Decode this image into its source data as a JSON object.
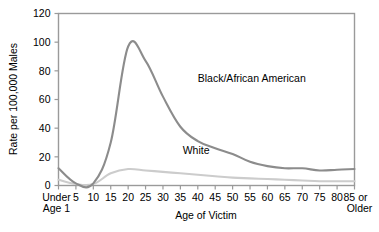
{
  "chart_data": {
    "type": "line",
    "title": "",
    "xlabel": "Age of Victim",
    "ylabel": "Rate per 100,000 Males",
    "xlim": [
      0,
      18
    ],
    "ylim": [
      0,
      120
    ],
    "grid": false,
    "legend_position": "inline-annotation",
    "ytick_labels": [
      "0",
      "20",
      "40",
      "60",
      "80",
      "100",
      "120"
    ],
    "ytick_values": [
      0,
      20,
      40,
      60,
      80,
      100,
      120
    ],
    "xtick_labels": [
      "Under Age 1",
      "5",
      "10",
      "15",
      "20",
      "25",
      "30",
      "35",
      "40",
      "45",
      "50",
      "55",
      "60",
      "65",
      "70",
      "75",
      "80",
      "85 or Older"
    ],
    "categories": [
      "Under Age 1",
      "5",
      "10",
      "15",
      "20",
      "25",
      "30",
      "35",
      "40",
      "45",
      "50",
      "55",
      "60",
      "65",
      "70",
      "75",
      "80",
      "85 or Older"
    ],
    "series": [
      {
        "name": "Black/African American",
        "color": "#8c8c8c",
        "values": [
          12.0,
          1.5,
          1.5,
          30.0,
          97.0,
          87.0,
          62.0,
          41.0,
          31.0,
          26.0,
          22.0,
          16.5,
          13.5,
          12.0,
          12.0,
          10.5,
          11.0,
          11.5
        ]
      },
      {
        "name": "White",
        "color": "#cccccc",
        "values": [
          4.0,
          1.0,
          1.0,
          8.5,
          11.5,
          10.5,
          9.5,
          8.5,
          7.5,
          6.5,
          5.5,
          5.0,
          4.5,
          4.0,
          3.5,
          3.0,
          3.0,
          3.0
        ]
      }
    ],
    "annotations": [
      {
        "text": "Black/African American",
        "x": 8.0,
        "y": 72
      },
      {
        "text": "White",
        "x": 7.9,
        "y": 22
      }
    ]
  },
  "axis": {
    "y_title": "Rate per 100,000 Males",
    "x_title": "Age of Victim",
    "x_first_label_line1": "Under",
    "x_first_label_line2": "Age 1",
    "x_last_label_line1": "85 or",
    "x_last_label_line2": "Older"
  },
  "colors": {
    "frame": "#9a9a9a",
    "black_series": "#8c8c8c",
    "white_series": "#cccccc",
    "text": "#000000",
    "background": "#ffffff"
  }
}
